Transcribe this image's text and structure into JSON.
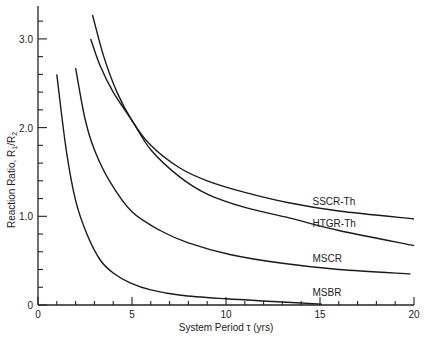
{
  "chart_data": {
    "type": "line",
    "title": "",
    "xlabel": "System Period τ (yrs)",
    "ylabel": "Reaction Ratio, R1/R2",
    "xlim": [
      0,
      20
    ],
    "ylim": [
      0,
      3.3
    ],
    "x_ticks": [
      0,
      5,
      10,
      15,
      20
    ],
    "x_tick_labels": [
      "0",
      "5",
      "10",
      "15",
      "20"
    ],
    "y_ticks": [
      0,
      1.0,
      2.0,
      3.0
    ],
    "y_tick_labels": [
      "0",
      "1.0",
      "2.0",
      "3.0"
    ],
    "grid": false,
    "legend": "inline labels at right end of curves",
    "series": [
      {
        "name": "SSCR-Th",
        "x": [
          2.9,
          3.5,
          4.2,
          5.0,
          6.0,
          7.5,
          9.0,
          11.0,
          13.4,
          16.0,
          20.0
        ],
        "y": [
          3.27,
          2.8,
          2.4,
          2.08,
          1.8,
          1.55,
          1.4,
          1.27,
          1.15,
          1.06,
          0.97
        ]
      },
      {
        "name": "HTGR-Th",
        "x": [
          2.8,
          3.3,
          4.0,
          5.0,
          6.0,
          7.5,
          9.0,
          11.0,
          13.4,
          16.0,
          20.0
        ],
        "y": [
          3.0,
          2.7,
          2.4,
          2.08,
          1.75,
          1.45,
          1.25,
          1.1,
          0.98,
          0.84,
          0.67
        ]
      },
      {
        "name": "MSCR",
        "x": [
          2.0,
          2.5,
          3.0,
          3.8,
          5.0,
          6.5,
          8.0,
          10.2,
          13.0,
          16.0,
          19.8
        ],
        "y": [
          2.67,
          2.1,
          1.75,
          1.4,
          1.05,
          0.84,
          0.7,
          0.57,
          0.47,
          0.4,
          0.35
        ]
      },
      {
        "name": "MSBR",
        "x": [
          1.0,
          1.5,
          2.0,
          2.6,
          3.3,
          4.0,
          4.9,
          6.0,
          7.6,
          10.0,
          12.5,
          15.1
        ],
        "y": [
          2.6,
          1.75,
          1.18,
          0.8,
          0.51,
          0.36,
          0.25,
          0.17,
          0.11,
          0.07,
          0.04,
          0.01
        ]
      }
    ],
    "labels": [
      {
        "text": "SSCR-Th",
        "x": 14.6,
        "y": 1.13
      },
      {
        "text": "HTGR-Th",
        "x": 14.6,
        "y": 0.88
      },
      {
        "text": "MSCR",
        "x": 14.6,
        "y": 0.48
      },
      {
        "text": "MSBR",
        "x": 14.6,
        "y": 0.1
      }
    ]
  },
  "axes": {
    "x_title": "System Period τ (yrs)",
    "y_title_main": "Reaction Ratio, R",
    "y_title_sub1": "1",
    "y_title_mid": "/R",
    "y_title_sub2": "2"
  }
}
